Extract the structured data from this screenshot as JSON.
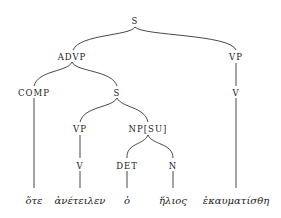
{
  "diagram": {
    "type": "syntax-tree",
    "nodes": {
      "root": {
        "label": "S"
      },
      "advp": {
        "label": "ADVP"
      },
      "vp_main": {
        "label": "VP"
      },
      "comp": {
        "label": "COMP"
      },
      "s_sub": {
        "label": "S"
      },
      "v_main": {
        "label": "V"
      },
      "vp_sub": {
        "label": "VP"
      },
      "np_su": {
        "label": "NP[SU]"
      },
      "v_sub": {
        "label": "V"
      },
      "det": {
        "label": "DET"
      },
      "n": {
        "label": "N"
      }
    },
    "leaves": {
      "ote": {
        "label": "ὅτε"
      },
      "aneteilen": {
        "label": "ἀνέτειλεν"
      },
      "ho": {
        "label": "ὁ"
      },
      "helios": {
        "label": "ἥλιος"
      },
      "ekaumatisthe": {
        "label": "ἐκαυματίσθη"
      }
    },
    "edges": [
      [
        "root",
        "advp"
      ],
      [
        "root",
        "vp_main"
      ],
      [
        "advp",
        "comp"
      ],
      [
        "advp",
        "s_sub"
      ],
      [
        "vp_main",
        "v_main"
      ],
      [
        "s_sub",
        "vp_sub"
      ],
      [
        "s_sub",
        "np_su"
      ],
      [
        "vp_sub",
        "v_sub"
      ],
      [
        "np_su",
        "det"
      ],
      [
        "np_su",
        "n"
      ],
      [
        "comp",
        "ote"
      ],
      [
        "v_sub",
        "aneteilen"
      ],
      [
        "det",
        "ho"
      ],
      [
        "n",
        "helios"
      ],
      [
        "v_main",
        "ekaumatisthe"
      ]
    ]
  }
}
